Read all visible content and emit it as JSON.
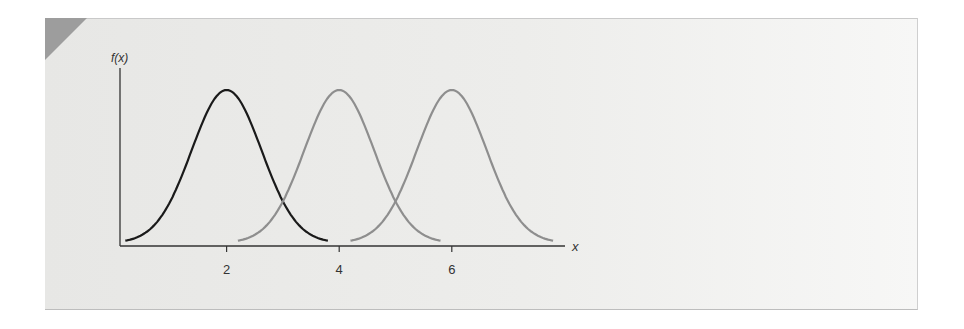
{
  "chart_data": {
    "type": "line",
    "title": "",
    "xlabel": "x",
    "ylabel": "f(x)",
    "x_ticks": [
      2,
      4,
      6
    ],
    "xlim": [
      0,
      8
    ],
    "grid": false,
    "legend": null,
    "series": [
      {
        "name": "density mean 2",
        "mean": 2,
        "color": "#1a1a1a",
        "x_range": [
          0.2,
          3.8
        ]
      },
      {
        "name": "density mean 4",
        "mean": 4,
        "color": "#8e8e8e",
        "x_range": [
          2.2,
          5.8
        ]
      },
      {
        "name": "density mean 6",
        "mean": 6,
        "color": "#8e8e8e",
        "x_range": [
          4.2,
          7.8
        ]
      }
    ],
    "note": "Three identical normal density curves with equal spread, shifted along x (means 2, 4, 6)."
  },
  "axes": {
    "y_label": "f(x)",
    "x_label": "x",
    "tick_labels": [
      "2",
      "4",
      "6"
    ]
  }
}
